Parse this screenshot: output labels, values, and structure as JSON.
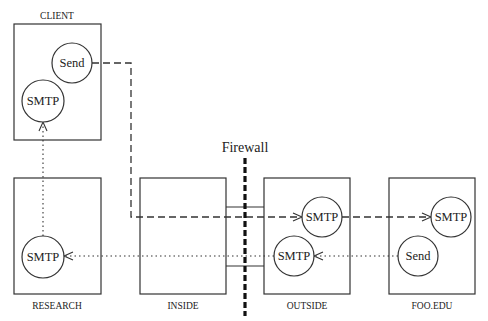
{
  "diagram": {
    "firewall": {
      "label": "Firewall"
    },
    "boxes": {
      "client": {
        "label": "CLIENT"
      },
      "research": {
        "label": "RESEARCH"
      },
      "inside": {
        "label": "INSIDE"
      },
      "outside": {
        "label": "OUTSIDE"
      },
      "foo_edu": {
        "label": "FOO.EDU"
      }
    },
    "nodes": {
      "client_send": {
        "label": "Send"
      },
      "client_smtp": {
        "label": "SMTP"
      },
      "research_smtp": {
        "label": "SMTP"
      },
      "outside_smtp_upper": {
        "label": "SMTP"
      },
      "outside_smtp_lower": {
        "label": "SMTP"
      },
      "foo_smtp": {
        "label": "SMTP"
      },
      "foo_send": {
        "label": "Send"
      }
    },
    "edges": [
      {
        "from": "CLIENT Send",
        "to": "OUTSIDE SMTP",
        "style": "dashed"
      },
      {
        "from": "OUTSIDE SMTP",
        "to": "FOO.EDU SMTP",
        "style": "dashed"
      },
      {
        "from": "FOO.EDU Send",
        "to": "OUTSIDE SMTP",
        "style": "dotted"
      },
      {
        "from": "OUTSIDE SMTP",
        "to": "RESEARCH SMTP",
        "style": "dotted"
      },
      {
        "from": "RESEARCH SMTP",
        "to": "CLIENT SMTP",
        "style": "dotted"
      }
    ]
  }
}
